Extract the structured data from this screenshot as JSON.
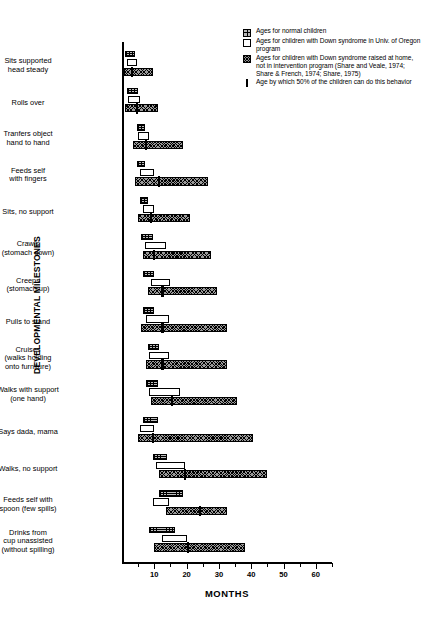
{
  "axes": {
    "xlabel": "MONTHS",
    "ylabel": "DEVELOPMENTAL MILESTONES",
    "xlim": [
      0,
      65
    ],
    "xticks": [
      10,
      20,
      30,
      40,
      50,
      60
    ],
    "xtick_labels": [
      "10",
      "20",
      "30",
      "40",
      "50",
      "60"
    ],
    "xminor_step": 5,
    "grid": false
  },
  "legend": {
    "position": "top-right",
    "entries": [
      {
        "swatch": "normal-swatch-icon",
        "label": "Ages for normal children"
      },
      {
        "swatch": "oregon-swatch-icon",
        "label": "Ages for children with Down syndrome in Univ. of Oregon program"
      },
      {
        "swatch": "home-swatch-icon",
        "label": "Ages for children with Down syndrome raised at home, not in intervention program (Share and Veale, 1974; Share & French, 1974; Share, 1975)"
      },
      {
        "swatch": "median-tick-icon",
        "label": "Age by which 50% of the children can do this behavior"
      }
    ]
  },
  "colors": {
    "normal_fill": "#bdbdbd",
    "oregon_fill": "#ffffff",
    "home_fill": "#9a9a9a",
    "outline": "#000000",
    "tick_marker": "#000000",
    "background": "#ffffff"
  },
  "chart_data": {
    "type": "bar",
    "orientation": "horizontal",
    "title": "",
    "xlabel": "MONTHS",
    "ylabel": "DEVELOPMENTAL MILESTONES",
    "xlim": [
      0,
      65
    ],
    "unit": "months",
    "note": "Each milestone shows three age-range bars (span of ages) plus a median tick on the home-raised bar.",
    "series": [
      {
        "name": "Ages for normal children",
        "key": "normal"
      },
      {
        "name": "Ages for children with Down syndrome in Univ. of Oregon program",
        "key": "oregon"
      },
      {
        "name": "Ages for children with Down syndrome raised at home, not in intervention program",
        "key": "home"
      }
    ],
    "categories": [
      "Sits supported head steady",
      "Rolls over",
      "Tranfers object hand to hand",
      "Feeds self with fingers",
      "Sits, no support",
      "Crawls (stomach down)",
      "Creeps (stomach up)",
      "Pulls to stand",
      "Cruises (walks holding onto furniture)",
      "Walks with support (one hand)",
      "Says dada, mama",
      "Walks, no support",
      "Feeds self with spoon (few spills)",
      "Drinks from cup unassisted (without spilling)"
    ],
    "rows": [
      {
        "label_lines": [
          "Sits supported",
          "head steady"
        ],
        "normal": [
          1.0,
          4.0
        ],
        "oregon": [
          1.5,
          4.5
        ],
        "home": [
          0.5,
          9.5
        ],
        "median50": 3.0
      },
      {
        "label_lines": [
          "Rolls over"
        ],
        "normal": [
          1.5,
          5.0
        ],
        "oregon": [
          2.0,
          5.5
        ],
        "home": [
          1.0,
          11.0
        ],
        "median50": 4.5
      },
      {
        "label_lines": [
          "Tranfers object",
          "hand to hand"
        ],
        "normal": [
          4.5,
          7.0
        ],
        "oregon": [
          5.0,
          8.5
        ],
        "home": [
          3.5,
          19.0
        ],
        "median50": 7.5
      },
      {
        "label_lines": [
          "Feeds self",
          "with fingers"
        ],
        "normal": [
          4.5,
          7.0
        ],
        "oregon": [
          5.5,
          10.0
        ],
        "home": [
          4.0,
          26.5
        ],
        "median50": 11.5
      },
      {
        "label_lines": [
          "Sits, no support"
        ],
        "normal": [
          5.5,
          8.0
        ],
        "oregon": [
          6.5,
          10.0
        ],
        "home": [
          5.0,
          21.0
        ],
        "median50": 9.0
      },
      {
        "label_lines": [
          "Crawls",
          "(stomach down)"
        ],
        "normal": [
          6.0,
          9.5
        ],
        "oregon": [
          7.0,
          13.5
        ],
        "home": [
          6.5,
          27.5
        ],
        "median50": 10.0
      },
      {
        "label_lines": [
          "Creeps",
          "(stomach up)"
        ],
        "normal": [
          6.5,
          10.0
        ],
        "oregon": [
          9.0,
          15.0
        ],
        "home": [
          8.0,
          29.5
        ],
        "median50": 12.5
      },
      {
        "label_lines": [
          "Pulls to stand"
        ],
        "normal": [
          6.5,
          10.0
        ],
        "oregon": [
          7.5,
          14.5
        ],
        "home": [
          6.0,
          32.5
        ],
        "median50": 12.5
      },
      {
        "label_lines": [
          "Cruises",
          "(walks holding",
          "onto furniture)"
        ],
        "normal": [
          8.0,
          11.5
        ],
        "oregon": [
          8.5,
          14.5
        ],
        "home": [
          7.5,
          32.5
        ],
        "median50": 12.5
      },
      {
        "label_lines": [
          "Walks with support",
          "(one hand)"
        ],
        "normal": [
          7.5,
          11.0
        ],
        "oregon": [
          8.5,
          18.0
        ],
        "home": [
          9.0,
          35.5
        ],
        "median50": 15.5
      },
      {
        "label_lines": [
          "Says dada, mama"
        ],
        "normal": [
          6.5,
          11.0
        ],
        "oregon": [
          5.5,
          10.0
        ],
        "home": [
          5.0,
          40.5
        ],
        "median50": 9.5
      },
      {
        "label_lines": [
          "Walks, no support"
        ],
        "normal": [
          9.5,
          14.0
        ],
        "oregon": [
          10.5,
          19.5
        ],
        "home": [
          11.5,
          45.0
        ],
        "median50": 19.5
      },
      {
        "label_lines": [
          "Feeds self with",
          "spoon (few spills)"
        ],
        "normal": [
          11.5,
          19.0
        ],
        "oregon": [
          9.5,
          14.5
        ],
        "home": [
          13.5,
          32.5
        ],
        "median50": 24.0
      },
      {
        "label_lines": [
          "Drinks from",
          "cup unassisted",
          "(without spilling)"
        ],
        "normal": [
          8.5,
          16.5
        ],
        "oregon": [
          12.5,
          20.0
        ],
        "home": [
          10.0,
          38.0
        ],
        "median50": 20.5
      }
    ]
  }
}
